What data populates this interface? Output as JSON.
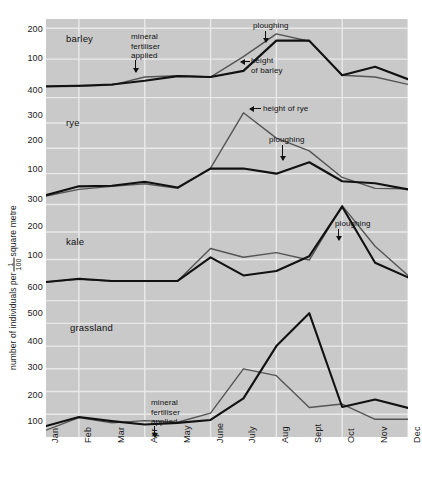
{
  "chart_data": {
    "type": "line",
    "title": "",
    "ylabel": "number of individuals per 1/100 square metre",
    "ylabel_prefix": "number of individuals per",
    "ylabel_fraction_numerator": "1",
    "ylabel_fraction_denominator": "100",
    "ylabel_suffix": "square metre",
    "xlabel": "",
    "grid": true,
    "x": [
      "Jan",
      "Feb",
      "Mar",
      "Apr",
      "May",
      "June",
      "July",
      "Aug",
      "Sept",
      "Oct",
      "Nov",
      "Dec"
    ],
    "panels": [
      {
        "name": "barley",
        "ylim": [
          0,
          230
        ],
        "yticks": [
          200,
          100
        ],
        "series": [
          {
            "name": "number of individuals",
            "color": "#111111",
            "width": 2.1,
            "values": [
              12,
              14,
              18,
              30,
              45,
              42,
              62,
              160,
              160,
              48,
              75,
              35
            ]
          },
          {
            "name": "height of barley",
            "color": "#555555",
            "width": 1.4,
            "values": [
              10,
              12,
              16,
              42,
              46,
              42,
              108,
              182,
              158,
              48,
              42,
              18
            ]
          }
        ],
        "annotations": [
          {
            "text": "mineral\nfertiliser\napplied",
            "type": "arrow-down"
          },
          {
            "text": "ploughing",
            "type": "arrow-down"
          },
          {
            "text": "height\nof barley",
            "type": "arrow-left"
          }
        ]
      },
      {
        "name": "rye",
        "ylim": [
          0,
          430
        ],
        "yticks": [
          400,
          300,
          200,
          100
        ],
        "series": [
          {
            "name": "number of individuals",
            "color": "#111111",
            "width": 2.1,
            "values": [
              15,
              50,
              52,
              68,
              45,
              120,
              120,
              100,
              145,
              70,
              62,
              38
            ]
          },
          {
            "name": "height of rye",
            "color": "#555555",
            "width": 1.4,
            "values": [
              12,
              38,
              50,
              60,
              42,
              122,
              340,
              240,
              190,
              85,
              42,
              40
            ]
          }
        ],
        "annotations": [
          {
            "text": "height of rye",
            "type": "arrow-left"
          },
          {
            "text": "ploughing",
            "type": "arrow-down"
          }
        ]
      },
      {
        "name": "kale",
        "ylim": [
          0,
          320
        ],
        "yticks": [
          300,
          200,
          100
        ],
        "series": [
          {
            "name": "number of individuals",
            "color": "#111111",
            "width": 2.1,
            "values": [
              18,
              30,
              22,
              22,
              22,
              108,
              42,
              58,
              112,
              292,
              88,
              35
            ]
          },
          {
            "name": "height of kale",
            "color": "#555555",
            "width": 1.4,
            "values": [
              18,
              28,
              22,
              22,
              22,
              140,
              108,
              125,
              98,
              296,
              148,
              42
            ]
          }
        ],
        "annotations": [
          {
            "text": "ploughing",
            "type": "arrow-down"
          }
        ]
      },
      {
        "name": "grassland",
        "ylim": [
          0,
          660
        ],
        "yticks": [
          600,
          500,
          400,
          300,
          200,
          100
        ],
        "series": [
          {
            "name": "number of individuals",
            "color": "#111111",
            "width": 2.1,
            "values": [
              48,
              88,
              70,
              55,
              62,
              75,
              170,
              400,
              545,
              132,
              165,
              128
            ]
          },
          {
            "name": "height of grass",
            "color": "#555555",
            "width": 1.4,
            "values": [
              30,
              85,
              62,
              72,
              65,
              105,
              300,
              270,
              130,
              145,
              78,
              78
            ]
          }
        ],
        "annotations": [
          {
            "text": "mineral\nfertiliser\napplied",
            "type": "arrow-down"
          }
        ]
      }
    ]
  },
  "axis": {
    "y_ticks": [
      {
        "label": "200",
        "y": 29
      },
      {
        "label": "100",
        "y": 58
      },
      {
        "label": "400",
        "y": 90
      },
      {
        "label": "300",
        "y": 115
      },
      {
        "label": "200",
        "y": 140
      },
      {
        "label": "100",
        "y": 169
      },
      {
        "label": "300",
        "y": 199
      },
      {
        "label": "200",
        "y": 226
      },
      {
        "label": "100",
        "y": 255
      },
      {
        "label": "600",
        "y": 287
      },
      {
        "label": "500",
        "y": 313
      },
      {
        "label": "400",
        "y": 341
      },
      {
        "label": "300",
        "y": 367
      },
      {
        "label": "200",
        "y": 395
      },
      {
        "label": "100",
        "y": 421
      }
    ],
    "x_ticks": [
      "Jan",
      "Feb",
      "Mar",
      "Apr",
      "May",
      "June",
      "July",
      "Aug",
      "Sept",
      "Oct",
      "Nov",
      "Dec"
    ]
  },
  "labels": {
    "barley": "barley",
    "rye": "rye",
    "kale": "kale",
    "grassland": "grassland",
    "mineral_fertiliser": "mineral\nfertiliser\napplied",
    "ploughing": "ploughing",
    "height_of_barley": "height\nof barley",
    "height_of_rye": "height of rye"
  }
}
